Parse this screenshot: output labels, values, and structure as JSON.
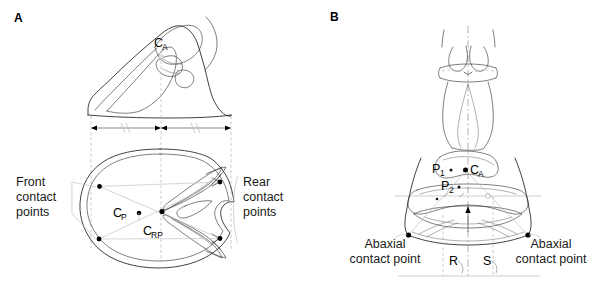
{
  "figure": {
    "domain": "anatomical-line-diagram",
    "background": "#ffffff",
    "ink_color": "#2b2b2b",
    "guide_color": "#b9b9b9",
    "width": 605,
    "height": 284
  },
  "panels": [
    {
      "id": "A",
      "letter": "A",
      "views": [
        "lateral hoof view (top)",
        "solar / ground-surface hoof view (bottom)"
      ],
      "point_labels": [
        {
          "name": "C_A",
          "base": "C",
          "sub": "A",
          "x": 161,
          "y": 47,
          "view": "lateral"
        },
        {
          "name": "C_P",
          "base": "C",
          "sub": "P",
          "x": 118,
          "y": 213,
          "view": "solar"
        },
        {
          "name": "C_RP",
          "base": "C",
          "sub": "RP",
          "x": 148,
          "y": 231,
          "view": "solar"
        }
      ],
      "annotations": [
        {
          "name": "front-contact-points",
          "lines": [
            "Front",
            "contact",
            "points"
          ],
          "x": 16,
          "y": 180,
          "align": "left"
        },
        {
          "name": "rear-contact-points",
          "lines": [
            "Rear",
            "contact",
            "points"
          ],
          "x": 243,
          "y": 180,
          "align": "left"
        }
      ],
      "contact_points": [
        {
          "name": "front-upper",
          "x": 99.5,
          "y": 186.5
        },
        {
          "name": "front-lower",
          "x": 99.0,
          "y": 239.0
        },
        {
          "name": "rear-upper",
          "x": 220.0,
          "y": 182.0
        },
        {
          "name": "rear-lower",
          "x": 220.0,
          "y": 238.5
        },
        {
          "name": "centroid-CP",
          "x": 139.0,
          "y": 213.0
        },
        {
          "name": "centroid-CRP",
          "x": 162.0,
          "y": 211.5
        }
      ],
      "dimension_row": {
        "name": "equal-width-dimensions",
        "y": 128,
        "left_span": [
          91,
          161
        ],
        "right_span": [
          161,
          231
        ],
        "tick_marks": "equal-length hash marks (//)"
      }
    },
    {
      "id": "B",
      "letter": "B",
      "views": [
        "dorsal / frontal view of digit and claws"
      ],
      "point_labels": [
        {
          "name": "P_1",
          "base": "P",
          "sub": "1",
          "x": 439,
          "y": 169,
          "view": "frontal"
        },
        {
          "name": "C_A",
          "base": "C",
          "sub": "A",
          "x": 474,
          "y": 169,
          "view": "frontal"
        },
        {
          "name": "P_2",
          "base": "P",
          "sub": "2",
          "x": 448,
          "y": 186,
          "view": "frontal"
        }
      ],
      "annotations": [
        {
          "name": "abaxial-contact-point-left",
          "lines": [
            "Abaxial",
            "contact point"
          ],
          "x": 385,
          "y": 248,
          "align": "center"
        },
        {
          "name": "abaxial-contact-point-right",
          "lines": [
            "Abaxial",
            "contact point"
          ],
          "x": 551,
          "y": 248,
          "align": "center"
        }
      ],
      "segment_labels": [
        {
          "name": "segment-R",
          "text": "R",
          "x": 453,
          "y": 262
        },
        {
          "name": "segment-S",
          "text": "S",
          "x": 487,
          "y": 262
        }
      ],
      "contact_points": [
        {
          "name": "abaxial-left",
          "x": 408.5,
          "y": 235.0
        },
        {
          "name": "abaxial-right",
          "x": 528.0,
          "y": 235.0
        },
        {
          "name": "centroid-CA",
          "x": 465.5,
          "y": 170.0
        }
      ]
    }
  ]
}
